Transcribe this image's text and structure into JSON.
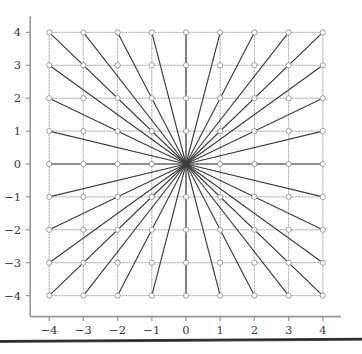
{
  "figure": {
    "title": "",
    "background_color": "#ffffff"
  },
  "axes": {
    "x_label": "",
    "y_label": "",
    "x_ticks": [
      "−4",
      "−3",
      "−2",
      "−1",
      "0",
      "1",
      "2",
      "3",
      "4"
    ],
    "y_ticks": [
      "4",
      "3",
      "2",
      "1",
      "0",
      "−1",
      "−2",
      "−3",
      "−4"
    ],
    "tick_color": "#555555",
    "spine_color": "#999999",
    "grid_color": "#bdbdbd",
    "dotted_grid_color": "#9a9a9a",
    "label_color": "#3a3a3a"
  },
  "series": {
    "ray_color": "#3c3c3c",
    "marker_edge_color": "#8c8c8c",
    "marker_face_color": "#ffffff",
    "marker_name": "open-circle"
  },
  "chart_data": {
    "type": "scatter",
    "title": "",
    "subtitle": "",
    "xlabel": "",
    "ylabel": "",
    "xlim": [
      -4.35,
      4.35
    ],
    "ylim": [
      -4.35,
      4.35
    ],
    "x_ticks": [
      -4,
      -3,
      -2,
      -1,
      0,
      1,
      2,
      3,
      4
    ],
    "y_ticks": [
      -4,
      -3,
      -2,
      -1,
      0,
      1,
      2,
      3,
      4
    ],
    "grid": true,
    "grid_style": "dotted-and-solid",
    "legend": null,
    "legend_position": "none",
    "lattice_range": [
      -4,
      4
    ],
    "lattice_point_count": 81,
    "marker_size": 5,
    "rays": {
      "origin": [
        0,
        0
      ],
      "endpoint_rule": "boundary lattice points (x,y) with max(|x|,|y|)=4 and gcd(|x|,|y|)=1, plus the four axis directions (±4,0) and (0,±4) and the four diagonals (±4,±4)",
      "endpoints": [
        [
          4,
          0
        ],
        [
          4,
          1
        ],
        [
          4,
          2
        ],
        [
          4,
          3
        ],
        [
          4,
          4
        ],
        [
          3,
          4
        ],
        [
          2,
          4
        ],
        [
          1,
          4
        ],
        [
          0,
          4
        ],
        [
          -1,
          4
        ],
        [
          -2,
          4
        ],
        [
          -3,
          4
        ],
        [
          -4,
          4
        ],
        [
          -4,
          3
        ],
        [
          -4,
          2
        ],
        [
          -4,
          1
        ],
        [
          -4,
          0
        ],
        [
          -4,
          -1
        ],
        [
          -4,
          -2
        ],
        [
          -4,
          -3
        ],
        [
          -4,
          -4
        ],
        [
          -3,
          -4
        ],
        [
          -2,
          -4
        ],
        [
          -1,
          -4
        ],
        [
          0,
          -4
        ],
        [
          1,
          -4
        ],
        [
          2,
          -4
        ],
        [
          3,
          -4
        ],
        [
          4,
          -4
        ],
        [
          4,
          -3
        ],
        [
          4,
          -2
        ],
        [
          4,
          -1
        ]
      ],
      "count": 32
    },
    "series": [
      {
        "name": "lattice points",
        "x": [
          -4,
          -3,
          -2,
          -1,
          0,
          1,
          2,
          3,
          4
        ],
        "y": [
          -4,
          -3,
          -2,
          -1,
          0,
          1,
          2,
          3,
          4
        ],
        "note": "full Cartesian product of x and y values"
      }
    ]
  },
  "artifacts": {
    "scan_edge_name": "page-bottom-edge"
  }
}
